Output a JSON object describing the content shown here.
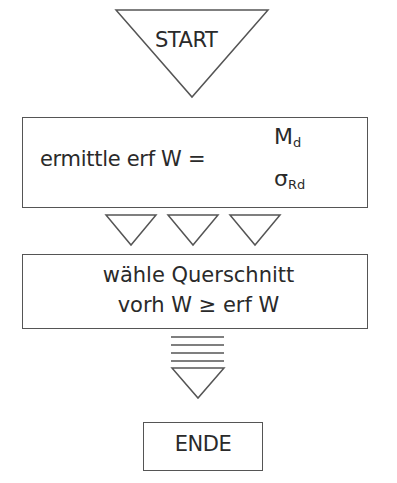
{
  "diagram": {
    "type": "flowchart",
    "start": {
      "label": "START",
      "shape": "inverted-triangle"
    },
    "step1": {
      "text": "ermittle erf W =",
      "fraction": {
        "numerator": "M",
        "numerator_sub": "d",
        "denominator": "σ",
        "denominator_sub": "Rd"
      },
      "shape": "rectangle"
    },
    "connector1": {
      "symbol": "three-inverted-triangles",
      "count": 3
    },
    "step2": {
      "line1": "wähle Querschnitt",
      "line2": "vorh W ≥ erf W",
      "shape": "rectangle"
    },
    "connector2": {
      "symbol": "stacked-lines-over-triangle",
      "line_count": 4
    },
    "end": {
      "label": "ENDE",
      "shape": "rectangle"
    }
  },
  "colors": {
    "stroke": "#555555",
    "text": "#2a2a2a",
    "background": "#ffffff"
  }
}
